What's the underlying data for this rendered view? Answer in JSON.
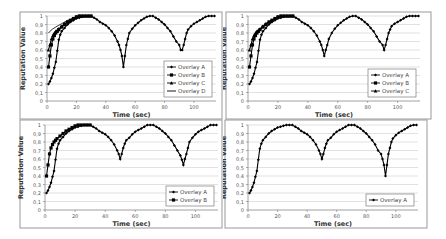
{
  "chart_data": [
    {
      "type": "line",
      "panel": "top-left",
      "title": "",
      "xlabel": "Time (sec)",
      "ylabel": "Reputation Value",
      "xlim": [
        0,
        115
      ],
      "ylim": [
        0,
        1
      ],
      "xticks": [
        "0",
        "20",
        "40",
        "60",
        "80",
        "100"
      ],
      "yticks": [
        "0",
        "0,1",
        "0,2",
        "0,3",
        "0,4",
        "0,5",
        "0,6",
        "0,7",
        "0,8",
        "0,9",
        "1"
      ],
      "grid": true,
      "legend_position": "lower-right",
      "series": [
        {
          "name": "Overlay A",
          "marker": "diamond",
          "x": [
            1,
            2,
            3,
            4,
            5,
            6,
            7,
            8,
            9,
            10,
            12,
            14,
            16,
            18,
            20,
            22,
            24,
            26,
            28,
            30,
            32,
            34,
            36,
            38,
            40,
            42,
            44,
            46,
            48,
            49,
            50,
            51,
            52,
            53,
            54,
            55,
            56,
            58,
            60,
            62,
            64,
            66,
            68,
            70,
            72,
            74,
            76,
            78,
            80,
            82,
            84,
            86,
            88,
            90,
            91,
            92,
            93,
            94,
            95,
            96,
            98,
            100,
            102,
            104,
            106,
            108,
            110,
            112,
            114
          ],
          "y": [
            0.2,
            0.23,
            0.27,
            0.32,
            0.39,
            0.46,
            0.59,
            0.72,
            0.78,
            0.82,
            0.86,
            0.9,
            0.93,
            0.95,
            0.97,
            0.98,
            0.99,
            1,
            1,
            1,
            0.98,
            0.96,
            0.93,
            0.91,
            0.89,
            0.86,
            0.82,
            0.77,
            0.7,
            0.66,
            0.6,
            0.53,
            0.4,
            0.53,
            0.66,
            0.73,
            0.8,
            0.85,
            0.89,
            0.92,
            0.95,
            0.97,
            0.99,
            1,
            1,
            0.98,
            0.96,
            0.93,
            0.9,
            0.86,
            0.82,
            0.76,
            0.7,
            0.66,
            0.6,
            0.6,
            0.66,
            0.73,
            0.8,
            0.84,
            0.88,
            0.91,
            0.93,
            0.95,
            0.97,
            0.99,
            1,
            1,
            1
          ]
        },
        {
          "name": "Overlay B",
          "marker": "square",
          "x": [
            1,
            2,
            3,
            4,
            5,
            6,
            7,
            8,
            10,
            12,
            14,
            16,
            18,
            20,
            22,
            24,
            26,
            28,
            30
          ],
          "y": [
            0.4,
            0.53,
            0.66,
            0.73,
            0.77,
            0.8,
            0.82,
            0.84,
            0.87,
            0.9,
            0.93,
            0.95,
            0.97,
            0.99,
            1,
            1,
            1,
            1,
            1
          ]
        },
        {
          "name": "Overlay C",
          "marker": "triangle",
          "x": [
            1,
            2,
            3,
            4,
            5,
            6,
            8,
            10,
            12,
            14,
            16,
            18,
            20,
            22,
            24,
            26,
            28,
            30
          ],
          "y": [
            0.6,
            0.66,
            0.73,
            0.77,
            0.8,
            0.82,
            0.85,
            0.88,
            0.91,
            0.93,
            0.95,
            0.97,
            0.99,
            1,
            1,
            1,
            1,
            1
          ]
        },
        {
          "name": "Overlay D",
          "marker": "line",
          "x": [
            1,
            2,
            4,
            6,
            8,
            10,
            12,
            14,
            16,
            18,
            20,
            22,
            24,
            26,
            28,
            30
          ],
          "y": [
            0.8,
            0.82,
            0.85,
            0.87,
            0.89,
            0.91,
            0.93,
            0.95,
            0.96,
            0.98,
            0.99,
            1,
            1,
            1,
            1,
            1
          ]
        }
      ]
    },
    {
      "type": "line",
      "panel": "top-right",
      "title": "",
      "xlabel": "Time (sec)",
      "ylabel": "Reputation Value",
      "xlim": [
        0,
        115
      ],
      "ylim": [
        0,
        1
      ],
      "xticks": [
        "0",
        "20",
        "40",
        "60",
        "80",
        "100"
      ],
      "yticks": [
        "0",
        "0,1",
        "0,2",
        "0,3",
        "0,4",
        "0,5",
        "0,6",
        "0,7",
        "0,8",
        "0,9",
        "1"
      ],
      "grid": true,
      "legend_position": "lower-right",
      "series": [
        {
          "name": "Overlay A",
          "marker": "diamond",
          "x": [
            1,
            2,
            3,
            4,
            5,
            6,
            7,
            8,
            9,
            10,
            12,
            14,
            16,
            18,
            20,
            22,
            24,
            26,
            28,
            30,
            32,
            34,
            36,
            38,
            40,
            42,
            44,
            46,
            48,
            49,
            50,
            51,
            52,
            53,
            54,
            56,
            58,
            60,
            62,
            64,
            66,
            68,
            70,
            72,
            74,
            76,
            78,
            80,
            82,
            84,
            86,
            88,
            90,
            91,
            92,
            93,
            94,
            95,
            96,
            98,
            100,
            102,
            104,
            106,
            108,
            110,
            112,
            114
          ],
          "y": [
            0.2,
            0.23,
            0.27,
            0.32,
            0.39,
            0.46,
            0.59,
            0.72,
            0.78,
            0.82,
            0.86,
            0.9,
            0.93,
            0.95,
            0.97,
            0.98,
            0.99,
            1,
            1,
            1,
            0.98,
            0.96,
            0.93,
            0.91,
            0.89,
            0.86,
            0.82,
            0.77,
            0.7,
            0.66,
            0.6,
            0.53,
            0.6,
            0.66,
            0.73,
            0.8,
            0.85,
            0.89,
            0.92,
            0.95,
            0.97,
            0.99,
            1,
            1,
            0.98,
            0.96,
            0.93,
            0.9,
            0.86,
            0.82,
            0.76,
            0.7,
            0.66,
            0.6,
            0.66,
            0.73,
            0.8,
            0.84,
            0.88,
            0.91,
            0.93,
            0.95,
            0.97,
            0.99,
            1,
            1,
            1,
            1
          ]
        },
        {
          "name": "Overlay B",
          "marker": "square",
          "x": [
            1,
            2,
            3,
            4,
            5,
            6,
            7,
            8,
            10,
            12,
            14,
            16,
            18,
            20,
            22,
            24,
            26,
            28,
            30
          ],
          "y": [
            0.4,
            0.53,
            0.66,
            0.73,
            0.77,
            0.8,
            0.82,
            0.84,
            0.87,
            0.9,
            0.93,
            0.95,
            0.97,
            0.99,
            1,
            1,
            1,
            1,
            1
          ]
        },
        {
          "name": "Overlay C",
          "marker": "triangle",
          "x": [
            1,
            2,
            3,
            4,
            5,
            6,
            8,
            10,
            12,
            14,
            16,
            18,
            20,
            22,
            24,
            26,
            28,
            30
          ],
          "y": [
            0.6,
            0.66,
            0.73,
            0.77,
            0.8,
            0.82,
            0.85,
            0.88,
            0.91,
            0.93,
            0.95,
            0.97,
            0.99,
            1,
            1,
            1,
            1,
            1
          ]
        }
      ]
    },
    {
      "type": "line",
      "panel": "bottom-left",
      "title": "",
      "xlabel": "Time (sec)",
      "ylabel": "Reputation Value",
      "xlim": [
        0,
        115
      ],
      "ylim": [
        0,
        1
      ],
      "xticks": [
        "0",
        "20",
        "40",
        "60",
        "80",
        "100"
      ],
      "yticks": [
        "0",
        "0,1",
        "0,2",
        "0,3",
        "0,4",
        "0,5",
        "0,6",
        "0,7",
        "0,8",
        "0,9",
        "1"
      ],
      "grid": true,
      "legend_position": "lower-right",
      "series": [
        {
          "name": "Overlay A",
          "marker": "diamond",
          "x": [
            1,
            2,
            3,
            4,
            5,
            6,
            7,
            8,
            9,
            10,
            12,
            14,
            16,
            18,
            20,
            22,
            24,
            26,
            28,
            30,
            32,
            34,
            36,
            38,
            40,
            42,
            44,
            46,
            48,
            49,
            50,
            51,
            52,
            53,
            54,
            56,
            58,
            60,
            62,
            64,
            66,
            68,
            70,
            72,
            74,
            76,
            78,
            80,
            82,
            84,
            86,
            88,
            90,
            91,
            92,
            93,
            94,
            95,
            96,
            98,
            100,
            102,
            104,
            106,
            108,
            110,
            112,
            114
          ],
          "y": [
            0.2,
            0.23,
            0.27,
            0.32,
            0.39,
            0.46,
            0.59,
            0.72,
            0.78,
            0.82,
            0.86,
            0.9,
            0.93,
            0.95,
            0.97,
            0.98,
            0.99,
            1,
            1,
            1,
            0.98,
            0.96,
            0.93,
            0.91,
            0.89,
            0.86,
            0.82,
            0.77,
            0.7,
            0.66,
            0.6,
            0.66,
            0.73,
            0.78,
            0.82,
            0.85,
            0.89,
            0.92,
            0.94,
            0.96,
            0.98,
            1,
            1,
            1,
            0.98,
            0.96,
            0.93,
            0.9,
            0.86,
            0.82,
            0.76,
            0.7,
            0.64,
            0.59,
            0.53,
            0.6,
            0.66,
            0.73,
            0.8,
            0.85,
            0.89,
            0.92,
            0.94,
            0.96,
            0.98,
            1,
            1,
            1
          ]
        },
        {
          "name": "Overlay B",
          "marker": "square",
          "x": [
            1,
            2,
            3,
            4,
            5,
            6,
            7,
            8,
            10,
            12,
            14,
            16,
            18,
            20,
            22,
            24,
            26,
            28,
            30
          ],
          "y": [
            0.4,
            0.53,
            0.66,
            0.73,
            0.77,
            0.8,
            0.82,
            0.84,
            0.87,
            0.9,
            0.93,
            0.95,
            0.97,
            0.99,
            1,
            1,
            1,
            1,
            1
          ]
        }
      ]
    },
    {
      "type": "line",
      "panel": "bottom-right",
      "title": "",
      "xlabel": "Time (sec)",
      "ylabel": "Reputation Value",
      "xlim": [
        0,
        115
      ],
      "ylim": [
        0,
        1
      ],
      "xticks": [
        "0",
        "20",
        "40",
        "60",
        "80",
        "100"
      ],
      "yticks": [
        "0",
        "0,1",
        "0,2",
        "0,3",
        "0,4",
        "0,5",
        "0,6",
        "0,7",
        "0,8",
        "0,9",
        "1"
      ],
      "grid": true,
      "legend_position": "lower-right",
      "series": [
        {
          "name": "Overlay A",
          "marker": "diamond",
          "x": [
            1,
            2,
            3,
            4,
            5,
            6,
            7,
            8,
            9,
            10,
            12,
            14,
            16,
            18,
            20,
            22,
            24,
            26,
            28,
            30,
            32,
            34,
            36,
            38,
            40,
            42,
            44,
            46,
            48,
            49,
            50,
            51,
            52,
            53,
            54,
            56,
            58,
            60,
            62,
            64,
            66,
            68,
            70,
            72,
            74,
            76,
            78,
            80,
            82,
            84,
            86,
            88,
            90,
            91,
            92,
            93,
            94,
            95,
            96,
            97,
            98,
            100,
            102,
            104,
            106,
            108,
            110,
            112,
            114
          ],
          "y": [
            0.2,
            0.23,
            0.27,
            0.32,
            0.39,
            0.46,
            0.59,
            0.72,
            0.78,
            0.82,
            0.86,
            0.9,
            0.93,
            0.95,
            0.97,
            0.98,
            0.99,
            1,
            1,
            1,
            0.98,
            0.96,
            0.93,
            0.91,
            0.89,
            0.86,
            0.82,
            0.77,
            0.7,
            0.66,
            0.6,
            0.66,
            0.73,
            0.78,
            0.82,
            0.85,
            0.89,
            0.92,
            0.94,
            0.96,
            0.98,
            1,
            1,
            1,
            0.98,
            0.96,
            0.93,
            0.9,
            0.86,
            0.82,
            0.77,
            0.7,
            0.66,
            0.6,
            0.53,
            0.4,
            0.53,
            0.66,
            0.73,
            0.8,
            0.84,
            0.88,
            0.91,
            0.93,
            0.95,
            0.97,
            0.99,
            1,
            1
          ]
        }
      ]
    }
  ],
  "style": {
    "line_color": "#000000",
    "grid_color": "#d4d4d4",
    "axis_color": "#888888",
    "text_color": "#555555",
    "border_color": "#999999"
  }
}
